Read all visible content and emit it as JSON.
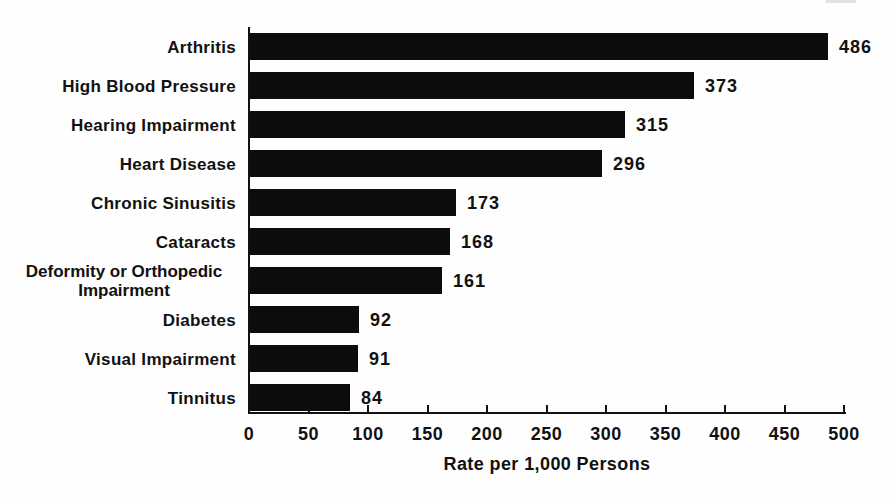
{
  "chart_data": {
    "type": "bar",
    "orientation": "horizontal",
    "categories": [
      "Arthritis",
      "High Blood Pressure",
      "Hearing Impairment",
      "Heart Disease",
      "Chronic Sinusitis",
      "Cataracts",
      "Deformity or Orthopedic Impairment",
      "Diabetes",
      "Visual Impairment",
      "Tinnitus"
    ],
    "values": [
      486,
      373,
      315,
      296,
      173,
      168,
      161,
      92,
      91,
      84
    ],
    "title": "",
    "xlabel": "Rate per 1,000 Persons",
    "ylabel": "",
    "xlim": [
      0,
      500
    ],
    "x_ticks": [
      0,
      50,
      100,
      150,
      200,
      250,
      300,
      350,
      400,
      450,
      500
    ],
    "grid": false,
    "legend": null,
    "value_labels_shown": true,
    "bar_color": "#0c0c0c",
    "text_color": "#111111",
    "background_color": "#fefefe"
  }
}
